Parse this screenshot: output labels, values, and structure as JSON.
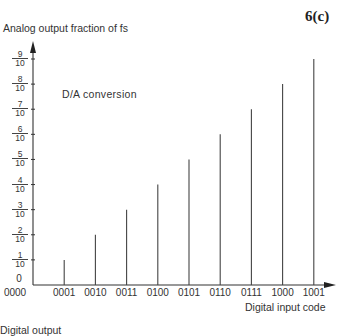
{
  "figure_label": "6(c)",
  "chart_data": {
    "type": "bar",
    "title": "D/A conversion",
    "annotation": "D/A conversion",
    "xlabel": "Digital input code",
    "ylabel": "Analog output fraction of fs",
    "categories": [
      "0000",
      "0001",
      "0010",
      "0011",
      "0100",
      "0101",
      "0110",
      "0111",
      "1000",
      "1001"
    ],
    "values": [
      0,
      0.1,
      0.2,
      0.3,
      0.4,
      0.5,
      0.6,
      0.7,
      0.8,
      0.9
    ],
    "ylim": [
      0,
      0.9
    ],
    "yticks": [
      {
        "num": "",
        "den": "",
        "label": "0",
        "value": 0
      },
      {
        "num": "1",
        "den": "10",
        "value": 0.1
      },
      {
        "num": "2",
        "den": "10",
        "value": 0.2
      },
      {
        "num": "3",
        "den": "10",
        "value": 0.3
      },
      {
        "num": "4",
        "den": "10",
        "value": 0.4
      },
      {
        "num": "5",
        "den": "10",
        "value": 0.5
      },
      {
        "num": "6",
        "den": "10",
        "value": 0.6
      },
      {
        "num": "7",
        "den": "10",
        "value": 0.7
      },
      {
        "num": "8",
        "den": "10",
        "value": 0.8
      },
      {
        "num": "9",
        "den": "10",
        "value": 0.9
      }
    ],
    "grid": false,
    "legend": null,
    "style": "stem lines"
  },
  "bottom_cutoff_text": "Digital output"
}
